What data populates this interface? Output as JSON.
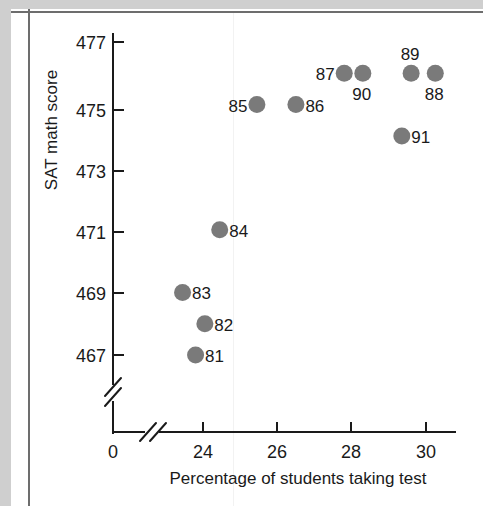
{
  "chart_data": {
    "type": "scatter",
    "title": "",
    "xlabel": "Percentage of students taking test",
    "ylabel": "SAT math score",
    "xlim": [
      22.7,
      30.8
    ],
    "ylim": [
      466.2,
      477.6
    ],
    "grid": false,
    "legend": false,
    "axis_break_x": true,
    "axis_break_y": true,
    "x_origin_label": "0",
    "xticks": [
      24,
      26,
      28,
      30
    ],
    "xtick_labels": [
      "24",
      "26",
      "28",
      "30"
    ],
    "yticks": [
      467,
      469,
      471,
      473,
      475,
      477
    ],
    "ytick_labels": [
      "467",
      "469",
      "471",
      "473",
      "475",
      "477"
    ],
    "marker_color": "#7a7a7a",
    "points": [
      {
        "label": "81",
        "x": 23.8,
        "y": 467.0,
        "label_side": "right"
      },
      {
        "label": "82",
        "x": 24.05,
        "y": 468.0,
        "label_side": "right"
      },
      {
        "label": "83",
        "x": 23.45,
        "y": 469.0,
        "label_side": "right"
      },
      {
        "label": "84",
        "x": 24.45,
        "y": 471.0,
        "label_side": "right"
      },
      {
        "label": "85",
        "x": 25.45,
        "y": 475.0,
        "label_side": "left"
      },
      {
        "label": "86",
        "x": 26.5,
        "y": 475.0,
        "label_side": "right"
      },
      {
        "label": "87",
        "x": 27.8,
        "y": 476.0,
        "label_side": "left"
      },
      {
        "label": "90",
        "x": 28.3,
        "y": 476.0,
        "label_side": "below"
      },
      {
        "label": "89",
        "x": 29.6,
        "y": 476.0,
        "label_side": "above"
      },
      {
        "label": "88",
        "x": 30.25,
        "y": 476.0,
        "label_side": "below"
      },
      {
        "label": "91",
        "x": 29.35,
        "y": 474.0,
        "label_side": "right"
      }
    ]
  },
  "figure": {
    "background_color": "#ffffff",
    "margin_color": "#cfcfcf",
    "frame_color": "#6d6d6d",
    "text_color": "#1a1a1a"
  }
}
